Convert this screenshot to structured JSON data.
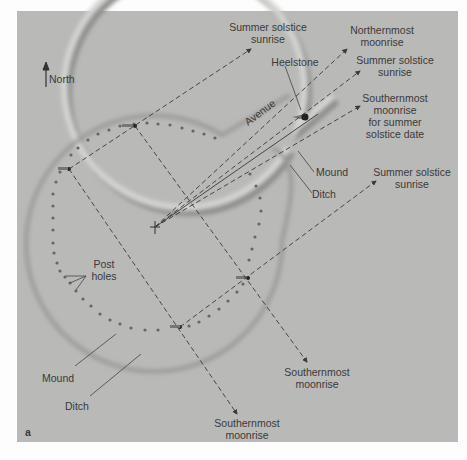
{
  "figure": {
    "panel_letter": "a",
    "north_label": "North",
    "colors": {
      "background": "#b9b9b7",
      "line": "#3a3a3a",
      "text": "#3a3a3a",
      "earthwork_highlight": "#d6d6d4",
      "earthwork_shadow": "#8e8e8c"
    }
  },
  "labels": {
    "summer_solstice_sunrise_1": [
      "Summer solstice",
      "sunrise"
    ],
    "northernmost_moonrise": [
      "Northernmost",
      "moonrise"
    ],
    "heelstone": "Heelstone",
    "summer_solstice_sunrise_2": [
      "Summer solstice",
      "sunrise"
    ],
    "southernmost_moonrise_summer": [
      "Southernmost",
      "moonrise",
      "for summer",
      "solstice date"
    ],
    "avenue": "Avenue",
    "mound_right": "Mound",
    "ditch_right": "Ditch",
    "summer_solstice_sunrise_3": [
      "Summer solstice",
      "sunrise"
    ],
    "post_holes": [
      "Post",
      "holes"
    ],
    "mound_left": "Mound",
    "ditch_left": "Ditch",
    "southernmost_moonrise_1": [
      "Southernmost",
      "moonrise"
    ],
    "southernmost_moonrise_2": [
      "Southernmost",
      "moonrise"
    ]
  }
}
